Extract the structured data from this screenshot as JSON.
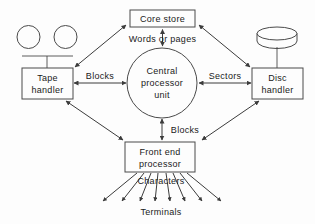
{
  "diagram": {
    "nodes": {
      "core_store": {
        "label": "Core store",
        "shape": "rectangle"
      },
      "tape_handler": {
        "label_line1": "Tape",
        "label_line2": "handler",
        "shape": "rectangle"
      },
      "disc_handler": {
        "label_line1": "Disc",
        "label_line2": "handler",
        "shape": "rectangle"
      },
      "cpu": {
        "label_line1": "Central",
        "label_line2": "processor",
        "label_line3": "unit",
        "shape": "circle"
      },
      "front_end": {
        "label_line1": "Front end",
        "label_line2": "processor",
        "shape": "rectangle"
      },
      "terminals": {
        "label": "Terminals",
        "shape": "text"
      },
      "tape_reel_left": {
        "shape": "circle"
      },
      "tape_reel_right": {
        "shape": "circle"
      },
      "disc_pack": {
        "shape": "cylinder"
      }
    },
    "edge_labels": {
      "core_to_cpu": "Words  or  pages",
      "tape_to_cpu": "Blocks",
      "disc_to_cpu": "Sectors",
      "cpu_to_front_end": "Blocks",
      "front_end_to_terminals": "Characters"
    },
    "terminal_arrow_count": 8,
    "colors": {
      "background": "#fdfdfd",
      "stroke": "#4a4a4a",
      "text": "#1a1a1a"
    }
  }
}
